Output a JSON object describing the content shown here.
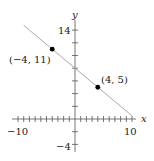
{
  "chart_data": {
    "type": "line",
    "title": "",
    "xlabel": "x",
    "ylabel": "y",
    "xlim": [
      -10,
      10
    ],
    "ylim": [
      -4,
      14
    ],
    "x_tick_labels": [
      "-10",
      "10"
    ],
    "y_tick_labels": [
      "14",
      "-4"
    ],
    "x_ticks": [
      -10,
      -9,
      -8,
      -7,
      -6,
      -5,
      -4,
      -3,
      -2,
      -1,
      1,
      2,
      3,
      4,
      5,
      6,
      7,
      8,
      9,
      10
    ],
    "y_ticks": [
      -4,
      -2,
      2,
      4,
      6,
      8,
      10,
      12,
      14
    ],
    "grid": false,
    "series": [
      {
        "name": "line through (-4,11) and (4,5)",
        "x": [
          -9,
          10
        ],
        "y": [
          14.75,
          0.5
        ],
        "slope": -0.75,
        "intercept": 8
      }
    ],
    "points": [
      {
        "x": -4,
        "y": 11,
        "label": "(−4, 11)"
      },
      {
        "x": 4,
        "y": 5,
        "label": "(4, 5)"
      }
    ],
    "colors": {
      "line": "#aaaaaa",
      "axes": "#555555",
      "points": "#000000"
    }
  },
  "labels": {
    "x_axis": "x",
    "y_axis": "y",
    "x_min": "−10",
    "x_max": "10",
    "y_max": "14",
    "y_min": "−4",
    "point1": "(−4, 11)",
    "point2": "(4, 5)"
  }
}
